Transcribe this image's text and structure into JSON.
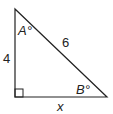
{
  "diagram": {
    "type": "right-triangle",
    "vertices": {
      "top": [
        15,
        9
      ],
      "right_angle": [
        15,
        97
      ],
      "right": [
        107,
        97
      ]
    },
    "labels": {
      "vertical_side": "4",
      "hypotenuse": "6",
      "horizontal_side": "x",
      "angle_top": "A°",
      "angle_right": "B°"
    },
    "colors": {
      "stroke": "#222222",
      "background": "#ffffff"
    }
  }
}
